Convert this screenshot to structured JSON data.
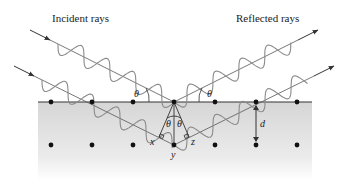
{
  "labels": {
    "incident": "Incident rays",
    "reflected": "Reflected rays"
  },
  "symbols": {
    "theta": "θ",
    "x": "x",
    "y": "y",
    "z": "z",
    "d": "d"
  },
  "colors": {
    "line": "#333333",
    "wave": "#8a8a8a",
    "atom": "#111111",
    "slab_top": "#d9d9d9",
    "slab_bottom": "#ffffff"
  },
  "lattice": {
    "surface_y": 102,
    "second_row_y": 145,
    "atom_x": [
      51,
      92,
      133,
      174,
      215,
      256,
      297
    ]
  }
}
